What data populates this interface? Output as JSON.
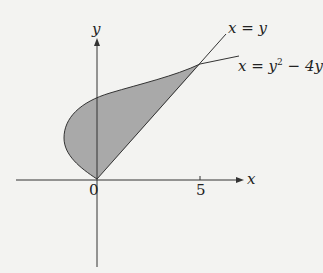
{
  "diagram": {
    "axes": {
      "x_label": "x",
      "y_label": "y"
    },
    "ticks": {
      "origin": "0",
      "x_tick": "5"
    },
    "curves": [
      {
        "name": "line",
        "label": "x = y"
      },
      {
        "name": "parabola",
        "label_prefix": "x = y",
        "label_sup": "2",
        "label_suffix": " − 4y"
      }
    ],
    "region": {
      "fill": "#a9a9a9",
      "description": "Region enclosed between x = y and x = y^2 - 4y"
    },
    "colors": {
      "stroke": "#333333",
      "fill": "#a9a9a9",
      "background": "#f3f3f1"
    }
  }
}
